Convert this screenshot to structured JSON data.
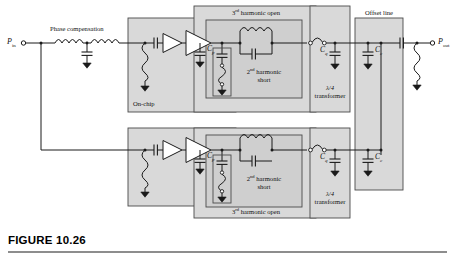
{
  "figure": {
    "number_label": "FIGURE 10.26",
    "domain": "rf-power-amplifier-schematic"
  },
  "ports": {
    "input": {
      "symbol": "P",
      "subscript": "in",
      "full": "P in"
    },
    "output": {
      "symbol": "P",
      "subscript": "out",
      "full": "P out"
    }
  },
  "block_labels": {
    "phase_compensation": "Phase compensation",
    "on_chip": "On-chip",
    "third_harmonic_open_top": "3",
    "third_harmonic_open_top_sup": "rd",
    "third_harmonic_open_top_rest": " harmonic open",
    "third_harmonic_open_bottom": "3",
    "third_harmonic_open_bottom_sup": "rd",
    "third_harmonic_open_bottom_rest": " harmonic open",
    "second_harmonic_short_top_num": "2",
    "second_harmonic_short_top_sup": "nd",
    "second_harmonic_short_top_rest": " harmonic",
    "second_harmonic_short_top_line2": "short",
    "second_harmonic_short_bottom_num": "2",
    "second_harmonic_short_bottom_sup": "nd",
    "second_harmonic_short_bottom_rest": " harmonic",
    "second_harmonic_short_bottom_line2": "short",
    "quarter_wave_top_line1": "λ/4",
    "quarter_wave_top_line2": "transformer",
    "quarter_wave_bottom_line1": "λ/4",
    "quarter_wave_bottom_line2": "transformer",
    "offset_line": "Offset line"
  },
  "components": {
    "cp_top": {
      "symbol": "C",
      "subscript": "p"
    },
    "cp_bottom": {
      "symbol": "C",
      "subscript": "p"
    },
    "cq_top": {
      "symbol": "C",
      "subscript": "q"
    },
    "cq_bottom": {
      "symbol": "C",
      "subscript": "q"
    },
    "cc_top": {
      "symbol": "C",
      "subscript": "c"
    },
    "cc_bottom": {
      "symbol": "C",
      "subscript": "c"
    }
  },
  "colors": {
    "wire": "#1a1a1a",
    "block_fill": "#d9d9d9",
    "block_fill_inner": "#cfcfcf",
    "block_stroke": "#3a3a3a",
    "page_background": "#ffffff",
    "caption_rule": "#8d8d8d",
    "text": "#111111"
  },
  "topology": {
    "description": "Two-way balanced power amplifier: input splits to carrier and peaking branches, each with phase compensation, on-chip two-stage amplifier, harmonic termination network, quarter-wave transformer, and offset line, recombining at the output.",
    "branches": [
      "top",
      "bottom"
    ],
    "stages_per_branch": [
      "input-matching",
      "driver-amplifier",
      "power-amplifier",
      "2nd-harmonic-short",
      "3rd-harmonic-open",
      "quarter-wave-transformer",
      "offset-line"
    ]
  }
}
